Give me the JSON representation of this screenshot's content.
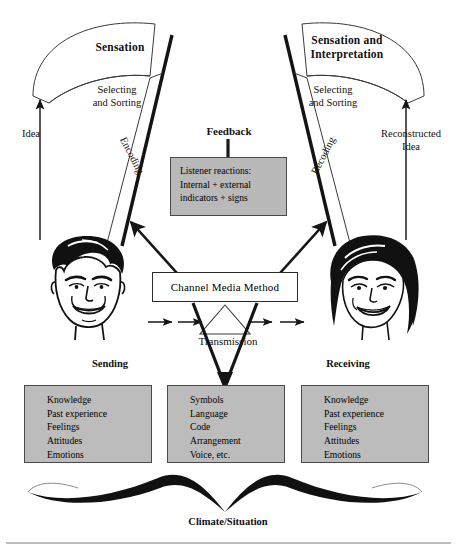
{
  "diagram": {
    "colors": {
      "gray_fill": "#bcbcbc",
      "feedback_fill": "#b9b9b9",
      "line": "#1a1a1a",
      "background": "#ffffff"
    }
  },
  "arcs": {
    "left": {
      "label": "Sensation"
    },
    "right": {
      "label": "Sensation and\nInterpretation"
    }
  },
  "funnel": {
    "left": {
      "selecting_label": "Selecting\nand Sorting",
      "process_label": "Encoding",
      "idea_label": "Idea",
      "role_label": "Sending",
      "face_icon": "male-face-icon"
    },
    "right": {
      "selecting_label": "Selecting\nand Sorting",
      "process_label": "Recoding",
      "idea_label": "Reconstructed\nIdea",
      "role_label": "Receiving",
      "face_icon": "female-face-icon"
    }
  },
  "feedback": {
    "title": "Feedback",
    "body": "Listener reactions:\nInternal + external\nindicators + signs"
  },
  "channel": {
    "label": "Channel Media Method",
    "transmission_label": "Transmission"
  },
  "attribute_boxes": {
    "sender": {
      "name": "Sender attributes",
      "items": "Knowledge\nPast experience\nFeelings\nAttitudes\nEmotions"
    },
    "message": {
      "name": "Message attributes",
      "items": "Symbols\nLanguage\nCode\nArrangement\nVoice, etc."
    },
    "receiver": {
      "name": "Receiver attributes",
      "items": "Knowledge\nPast experience\nFeelings\nAttitudes\nEmotions"
    }
  },
  "footer": {
    "climate_label": "Climate/Situation"
  }
}
